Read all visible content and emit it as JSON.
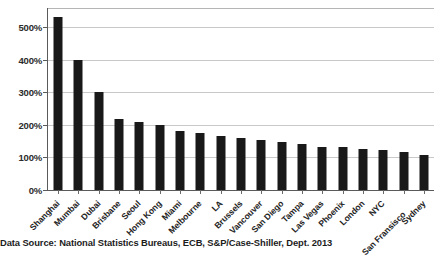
{
  "chart_data": {
    "type": "bar",
    "title": "",
    "xlabel": "",
    "ylabel": "",
    "ylim": [
      0,
      550
    ],
    "grid": true,
    "legend": null,
    "y_ticks": [
      "0%",
      "100%",
      "200%",
      "300%",
      "400%",
      "500%"
    ],
    "y_tick_values": [
      0,
      100,
      200,
      300,
      400,
      500
    ],
    "categories": [
      "Shanghai",
      "Mumbai",
      "Dubai",
      "Brisbane",
      "Seoul",
      "Hong Kong",
      "Miami",
      "Melbourne",
      "LA",
      "Brussels",
      "Vancouver",
      "San Diego",
      "Tampa",
      "Las Vegas",
      "Phoenix",
      "London",
      "NYC",
      "San Fransisco",
      "Sydney"
    ],
    "values": [
      530,
      400,
      302,
      218,
      208,
      200,
      182,
      176,
      165,
      160,
      152,
      148,
      140,
      133,
      131,
      126,
      122,
      118,
      107
    ],
    "bar_color": "#191919",
    "gridline_color": "#c9c9c9",
    "background_color": "#ffffff"
  },
  "footer": {
    "source_note": "Data Source: National Statistics Bureaus, ECB, S&P/Case-Shiller, Dept. 2013"
  }
}
